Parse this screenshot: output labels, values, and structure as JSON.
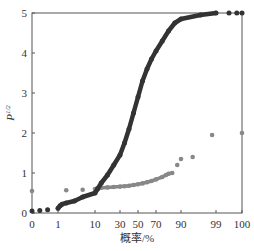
{
  "chart_data": {
    "type": "scatter",
    "title": "",
    "xlabel": "概率/%",
    "ylabel": "P^1/2",
    "ylabel_base": "P",
    "ylabel_sup": "1/2",
    "x_scale": "probability",
    "xticks": [
      "0",
      "1",
      "10",
      "30",
      "50",
      "70",
      "90",
      "99",
      "100"
    ],
    "yticks": [
      "0",
      "1",
      "2",
      "3",
      "4",
      "5"
    ],
    "ylim": [
      0,
      5
    ],
    "grid": false,
    "legend": null,
    "series": [
      {
        "name": "dark-series",
        "color": "#333333",
        "points": [
          [
            0,
            0.05
          ],
          [
            0.3,
            0.06
          ],
          [
            0.6,
            0.08
          ],
          [
            1,
            0.12
          ],
          [
            1.5,
            0.18
          ],
          [
            2,
            0.22
          ],
          [
            3,
            0.25
          ],
          [
            5,
            0.3
          ],
          [
            7,
            0.4
          ],
          [
            10,
            0.5
          ],
          [
            12,
            0.6
          ],
          [
            15,
            0.75
          ],
          [
            20,
            0.95
          ],
          [
            25,
            1.2
          ],
          [
            30,
            1.45
          ],
          [
            35,
            1.75
          ],
          [
            40,
            2.1
          ],
          [
            45,
            2.5
          ],
          [
            50,
            2.9
          ],
          [
            55,
            3.3
          ],
          [
            60,
            3.6
          ],
          [
            65,
            3.85
          ],
          [
            70,
            4.05
          ],
          [
            75,
            4.3
          ],
          [
            80,
            4.55
          ],
          [
            85,
            4.75
          ],
          [
            90,
            4.85
          ],
          [
            95,
            4.95
          ],
          [
            99,
            5.0
          ],
          [
            99.5,
            5.0
          ],
          [
            99.8,
            5.0
          ],
          [
            100,
            5.0
          ]
        ]
      },
      {
        "name": "gray-series",
        "color": "#888888",
        "points": [
          [
            0,
            0.55
          ],
          [
            3,
            0.57
          ],
          [
            7,
            0.58
          ],
          [
            10,
            0.6
          ],
          [
            12,
            0.62
          ],
          [
            15,
            0.63
          ],
          [
            20,
            0.64
          ],
          [
            25,
            0.65
          ],
          [
            30,
            0.66
          ],
          [
            35,
            0.67
          ],
          [
            40,
            0.68
          ],
          [
            45,
            0.7
          ],
          [
            50,
            0.72
          ],
          [
            55,
            0.74
          ],
          [
            60,
            0.77
          ],
          [
            65,
            0.8
          ],
          [
            70,
            0.84
          ],
          [
            75,
            0.9
          ],
          [
            78,
            0.95
          ],
          [
            80,
            0.98
          ],
          [
            83,
            1.0
          ],
          [
            87,
            1.2
          ],
          [
            90,
            1.35
          ],
          [
            93,
            1.4
          ],
          [
            98,
            1.95
          ],
          [
            100,
            2.0
          ]
        ]
      }
    ]
  },
  "axes": {
    "x_tick_px": {
      "0": 32,
      "1": 58,
      "10": 95,
      "30": 120,
      "50": 138,
      "70": 156,
      "90": 181,
      "99": 216,
      "100": 242
    },
    "frame": {
      "left": 32,
      "right": 242,
      "top": 13,
      "bottom": 213
    }
  }
}
